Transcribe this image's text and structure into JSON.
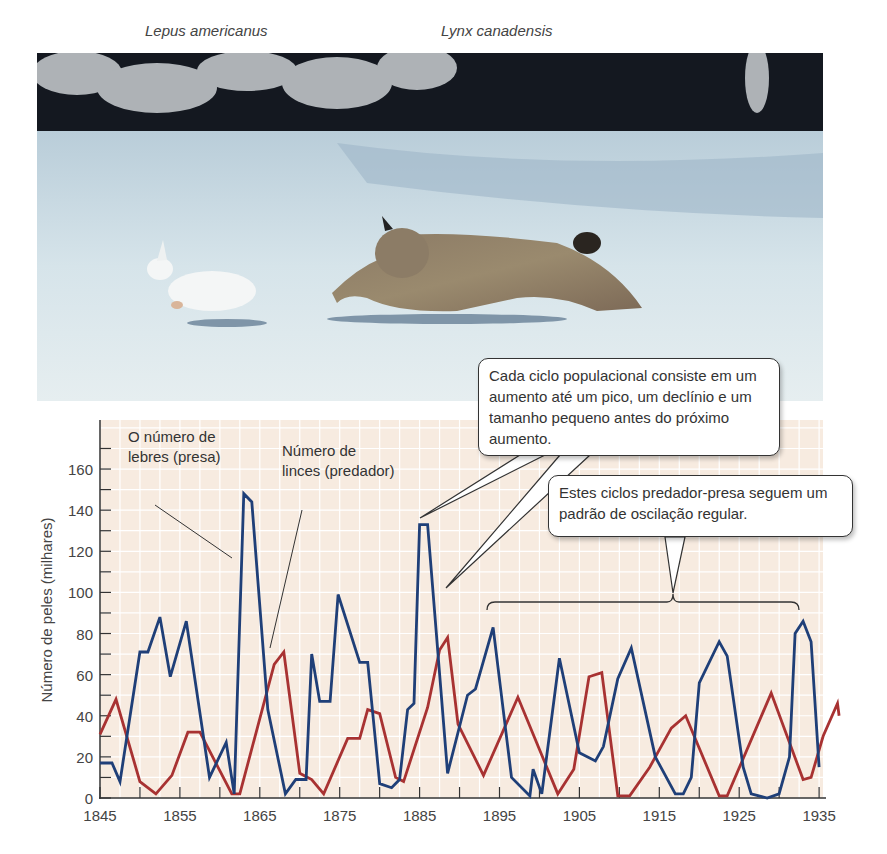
{
  "header": {
    "species_left": "Lepus americanus",
    "species_right": "Lynx canadensis"
  },
  "photo": {
    "description": "Snowshoe hare fleeing a Canada lynx across snow",
    "icons": [
      "hare-figure",
      "lynx-figure"
    ]
  },
  "annotations": {
    "hare_label_line1": "O número de",
    "hare_label_line2": "lebres (presa)",
    "lynx_label_line1": "Número de",
    "lynx_label_line2": "linces (predador)",
    "callout_cycle": "Cada ciclo populacional consiste em um aumento até um pico, um declínio e um tamanho pequeno antes do próximo aumento.",
    "callout_oscillation": "Estes ciclos predador-presa seguem um padrão de oscilação regular."
  },
  "colors": {
    "hare": "#1f3f78",
    "lynx": "#a83232",
    "plot_bg": "#f7ebe0",
    "grid": "#ffffff",
    "axis": "#333333"
  },
  "chart_data": {
    "type": "line",
    "title": "",
    "xlabel": "",
    "ylabel": "Número de peles (milhares)",
    "xlim": [
      1845,
      1937
    ],
    "ylim": [
      0,
      175
    ],
    "x_ticks": [
      1845,
      1855,
      1865,
      1875,
      1885,
      1895,
      1905,
      1915,
      1925,
      1935
    ],
    "y_ticks": [
      0,
      20,
      40,
      60,
      80,
      100,
      120,
      140,
      160
    ],
    "grid": true,
    "legend": "inline annotations",
    "series": [
      {
        "name": "O número de lebres (presa)",
        "color": "#1f3f78",
        "points": [
          [
            1845,
            17
          ],
          [
            1846.5,
            17
          ],
          [
            1847.5,
            8
          ],
          [
            1850,
            71
          ],
          [
            1851,
            71
          ],
          [
            1852.5,
            88
          ],
          [
            1853.8,
            59
          ],
          [
            1855.8,
            86
          ],
          [
            1858.7,
            10
          ],
          [
            1860.8,
            27
          ],
          [
            1861.8,
            2
          ],
          [
            1863,
            148
          ],
          [
            1864,
            144
          ],
          [
            1866,
            43
          ],
          [
            1868.2,
            2
          ],
          [
            1869.5,
            9
          ],
          [
            1870.8,
            9
          ],
          [
            1871.5,
            70
          ],
          [
            1872.5,
            47
          ],
          [
            1873.8,
            47
          ],
          [
            1874.8,
            99
          ],
          [
            1877.5,
            66
          ],
          [
            1878.5,
            66
          ],
          [
            1880,
            7
          ],
          [
            1881.5,
            5
          ],
          [
            1882.5,
            9
          ],
          [
            1883.5,
            43
          ],
          [
            1884.3,
            46
          ],
          [
            1885,
            133
          ],
          [
            1886,
            133
          ],
          [
            1888.5,
            12
          ],
          [
            1891,
            50
          ],
          [
            1892,
            53
          ],
          [
            1894.2,
            83
          ],
          [
            1896.5,
            10
          ],
          [
            1898.8,
            1
          ],
          [
            1899.2,
            14
          ],
          [
            1900.3,
            2
          ],
          [
            1902.5,
            68
          ],
          [
            1905,
            22
          ],
          [
            1907,
            18
          ],
          [
            1908,
            25
          ],
          [
            1909.8,
            58
          ],
          [
            1911.5,
            73
          ],
          [
            1914.5,
            20
          ],
          [
            1917,
            2
          ],
          [
            1918,
            2
          ],
          [
            1919,
            10
          ],
          [
            1920,
            56
          ],
          [
            1922.5,
            76
          ],
          [
            1923.5,
            69
          ],
          [
            1925.5,
            15
          ],
          [
            1926.5,
            2
          ],
          [
            1928.5,
            0
          ],
          [
            1930,
            2
          ],
          [
            1931.3,
            20
          ],
          [
            1932,
            80
          ],
          [
            1933,
            86
          ],
          [
            1934,
            76
          ],
          [
            1935,
            15
          ]
        ]
      },
      {
        "name": "Número de linces (predador)",
        "color": "#a83232",
        "points": [
          [
            1845,
            31
          ],
          [
            1847,
            48
          ],
          [
            1850,
            8
          ],
          [
            1852,
            2
          ],
          [
            1854,
            11
          ],
          [
            1856,
            32
          ],
          [
            1857.5,
            32
          ],
          [
            1861.5,
            2
          ],
          [
            1862.5,
            2
          ],
          [
            1866.8,
            65
          ],
          [
            1868,
            71
          ],
          [
            1870,
            12
          ],
          [
            1871.5,
            9
          ],
          [
            1873,
            2
          ],
          [
            1876,
            29
          ],
          [
            1877.5,
            29
          ],
          [
            1878.5,
            43
          ],
          [
            1880,
            41
          ],
          [
            1882,
            10
          ],
          [
            1883,
            8
          ],
          [
            1886,
            44
          ],
          [
            1887.5,
            72
          ],
          [
            1888.5,
            78
          ],
          [
            1889.8,
            36
          ],
          [
            1893,
            11
          ],
          [
            1897.3,
            49
          ],
          [
            1902.3,
            2
          ],
          [
            1904.3,
            14
          ],
          [
            1906.2,
            59
          ],
          [
            1907.8,
            61
          ],
          [
            1909.8,
            1
          ],
          [
            1911.3,
            1
          ],
          [
            1913.8,
            15
          ],
          [
            1916.5,
            34
          ],
          [
            1918.3,
            40
          ],
          [
            1922.5,
            1
          ],
          [
            1923.5,
            1
          ],
          [
            1929,
            51
          ],
          [
            1933,
            9
          ],
          [
            1934,
            10
          ],
          [
            1935.5,
            30
          ],
          [
            1937.3,
            46
          ],
          [
            1938,
            40
          ]
        ]
      }
    ]
  }
}
